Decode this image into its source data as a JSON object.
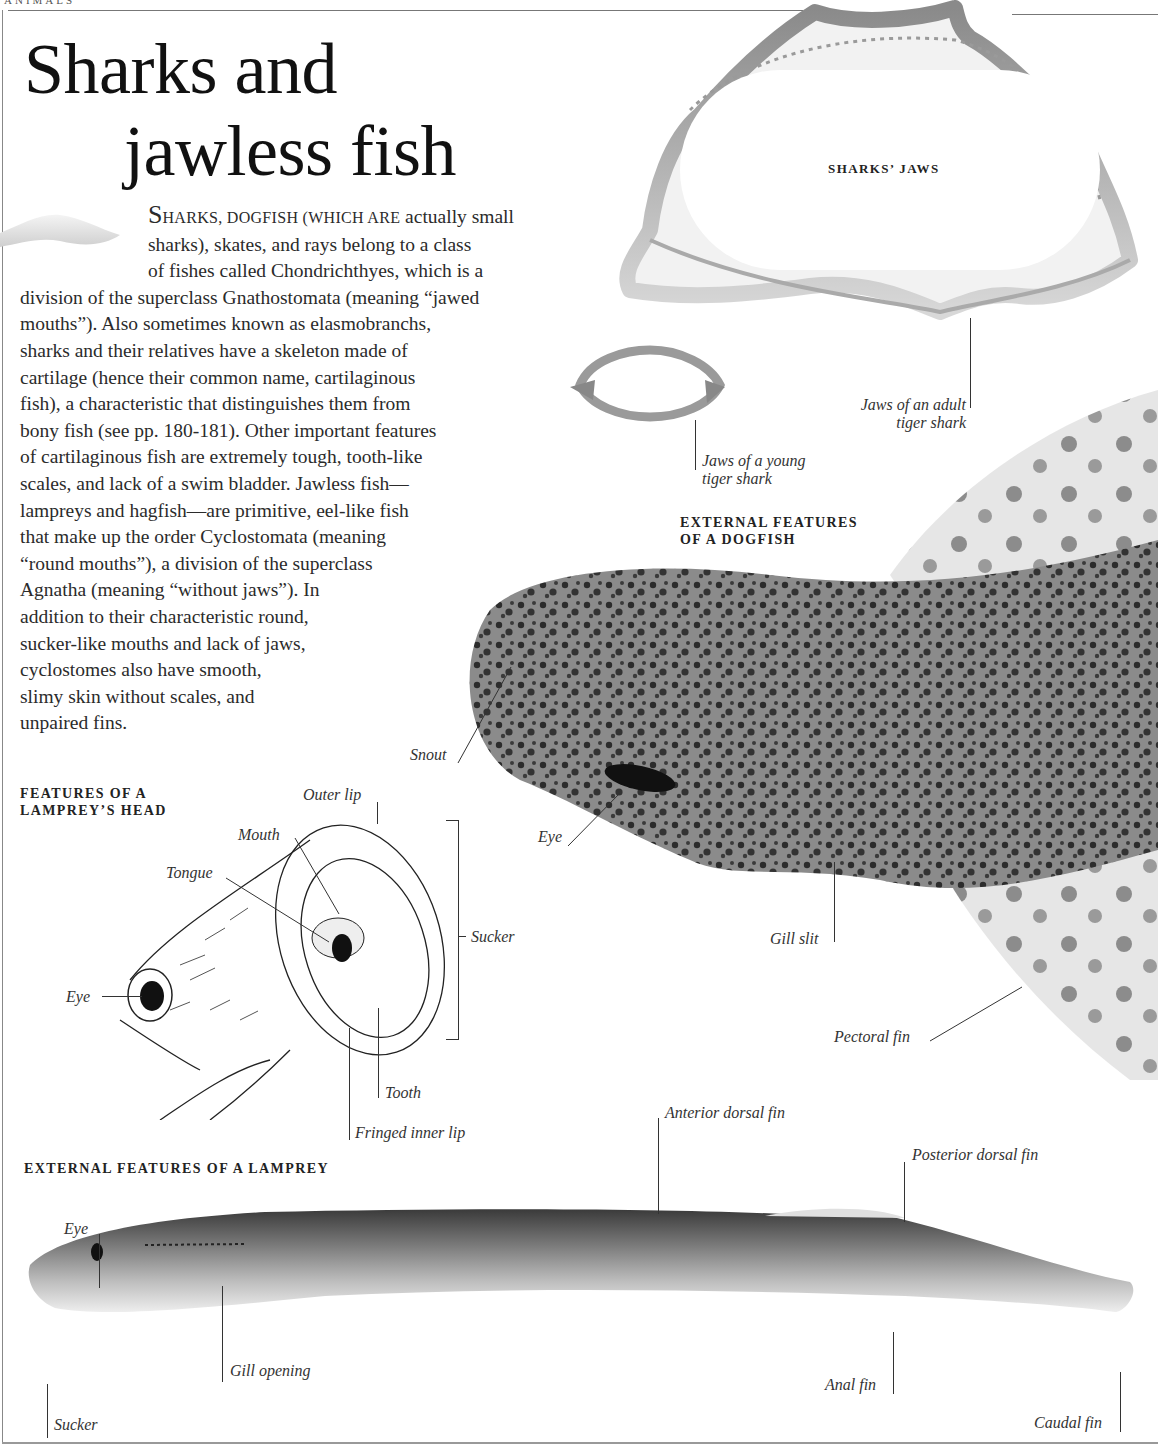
{
  "page": {
    "running_head": "ANIMALS",
    "title_line1": "Sharks and",
    "title_line2": "jawless fish"
  },
  "intro": {
    "lead_cap": "S",
    "lead_smallcaps": "HARKS, DOGFISH (WHICH ARE",
    "lines": [
      " actually small",
      "sharks), skates, and rays belong to a class",
      "of fishes called Chondrichthyes, which is a",
      "division of the superclass Gnathostomata (meaning “jawed",
      "mouths”). Also sometimes known as elasmobranchs,",
      "sharks and their relatives have a skeleton made of",
      "cartilage (hence their common name, cartilaginous",
      "fish), a characteristic that distinguishes them from",
      "bony fish (see pp. 180-181). Other important features",
      "of cartilaginous fish are extremely tough, tooth-like",
      "scales, and lack of a swim bladder. Jawless fish—",
      "lampreys and hagfish—are primitive, eel-like fish",
      "that make up the order Cyclostomata (meaning",
      "“round mouths”), a division of the superclass",
      "Agnatha (meaning “without jaws”). In",
      "addition to their characteristic round,",
      "sucker-like mouths and lack of jaws,",
      "cyclostomes also have smooth,",
      "slimy skin without scales, and",
      "unpaired fins."
    ]
  },
  "sharks_jaws": {
    "heading": "SHARKS’ JAWS",
    "adult_caption_1": "Jaws of  an adult",
    "adult_caption_2": "tiger shark",
    "young_caption_1": "Jaws of  a young",
    "young_caption_2": "tiger shark"
  },
  "dogfish": {
    "heading_1": "EXTERNAL FEATURES",
    "heading_2": "OF A DOGFISH",
    "labels": {
      "snout": "Snout",
      "eye": "Eye",
      "gill_slit": "Gill slit",
      "pectoral_fin": "Pectoral fin"
    }
  },
  "lamprey_head": {
    "heading_1": "FEATURES OF A",
    "heading_2": "LAMPREY’S HEAD",
    "labels": {
      "outer_lip": "Outer lip",
      "mouth": "Mouth",
      "tongue": "Tongue",
      "eye": "Eye",
      "sucker": "Sucker",
      "tooth": "Tooth",
      "fringed_inner_lip": "Fringed inner lip"
    }
  },
  "lamprey_body": {
    "heading": "EXTERNAL FEATURES OF A LAMPREY",
    "labels": {
      "eye": "Eye",
      "gill_opening": "Gill opening",
      "sucker": "Sucker",
      "anterior_dorsal_fin": "Anterior dorsal fin",
      "posterior_dorsal_fin": "Posterior dorsal fin",
      "anal_fin": "Anal fin",
      "caudal_fin": "Caudal fin"
    }
  }
}
